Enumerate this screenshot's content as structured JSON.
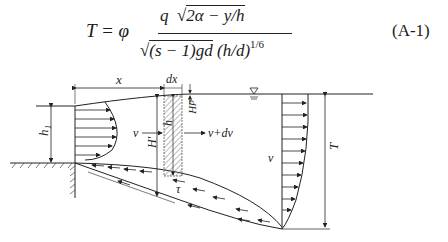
{
  "equation": {
    "lhs": "T = φ",
    "numerator_q": "q",
    "numerator_root": "2α − y/h",
    "denominator_root": "(s − 1)gd",
    "denominator_rest": "(h/d)",
    "exponent": "1/6",
    "number": "(A-1)"
  },
  "figure": {
    "labels": {
      "x": "x",
      "dx": "dx",
      "dH": "dH",
      "h1": "h₁",
      "H_prime": "H′",
      "h": "h",
      "v_left": "v",
      "v_plus_dv": "v+dv",
      "tau": "τ",
      "v_right": "v",
      "T": "T"
    }
  }
}
